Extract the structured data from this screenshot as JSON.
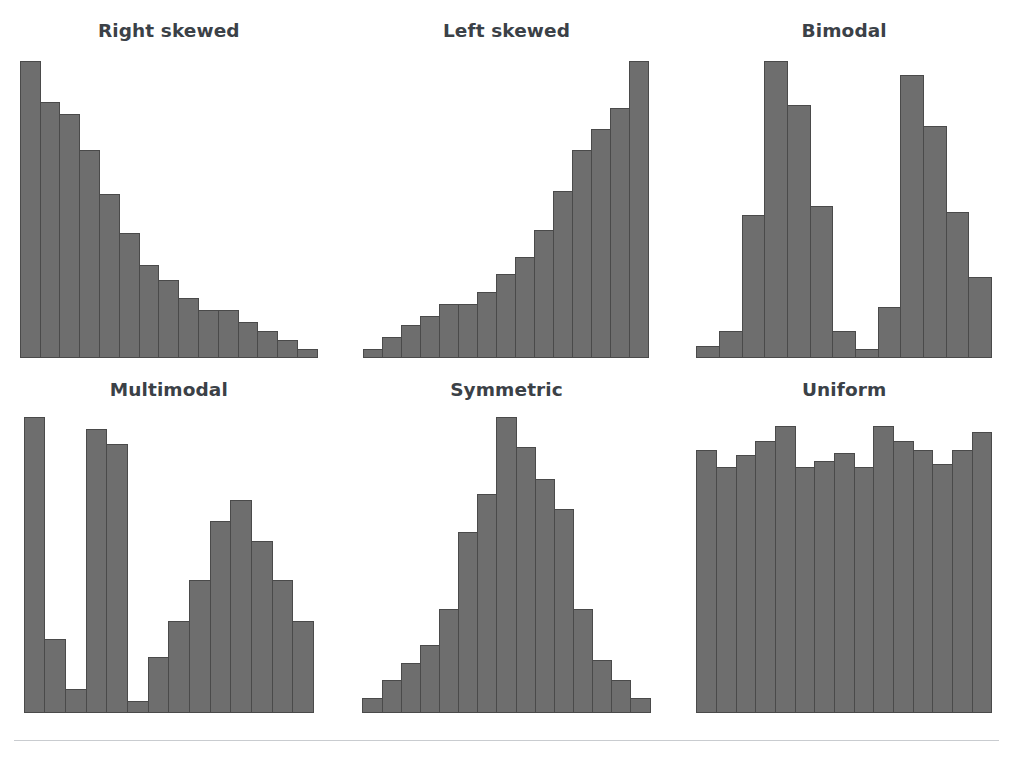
{
  "figure": {
    "background_color": "#ffffff",
    "bar_fill_color": "#6e6e6e",
    "bar_edge_color": "#4a4a4a",
    "title_color": "#3b4147",
    "rule_color": "#c9ccd0"
  },
  "panels": [
    {
      "title": "Right skewed"
    },
    {
      "title": "Left skewed"
    },
    {
      "title": "Bimodal"
    },
    {
      "title": "Multimodal"
    },
    {
      "title": "Symmetric"
    },
    {
      "title": "Uniform"
    }
  ],
  "chart_data": [
    {
      "type": "bar",
      "title": "Right skewed",
      "xlabel": "",
      "ylabel": "",
      "grid": false,
      "legend": false,
      "ylim": [
        0,
        100
      ],
      "categories": [
        "1",
        "2",
        "3",
        "4",
        "5",
        "6",
        "7",
        "8",
        "9",
        "10",
        "11",
        "12",
        "13",
        "14",
        "15"
      ],
      "values": [
        100,
        86,
        82,
        70,
        55,
        42,
        31,
        26,
        20,
        16,
        16,
        12,
        9,
        6,
        3
      ]
    },
    {
      "type": "bar",
      "title": "Left skewed",
      "xlabel": "",
      "ylabel": "",
      "grid": false,
      "legend": false,
      "ylim": [
        0,
        100
      ],
      "categories": [
        "1",
        "2",
        "3",
        "4",
        "5",
        "6",
        "7",
        "8",
        "9",
        "10",
        "11",
        "12",
        "13",
        "14",
        "15"
      ],
      "values": [
        3,
        7,
        11,
        14,
        18,
        18,
        22,
        28,
        34,
        43,
        56,
        70,
        77,
        84,
        100
      ]
    },
    {
      "type": "bar",
      "title": "Bimodal",
      "xlabel": "",
      "ylabel": "",
      "grid": false,
      "legend": false,
      "ylim": [
        0,
        100
      ],
      "categories": [
        "1",
        "2",
        "3",
        "4",
        "5",
        "6",
        "7",
        "8",
        "9",
        "10",
        "11",
        "12",
        "13"
      ],
      "values": [
        4,
        9,
        48,
        100,
        85,
        51,
        9,
        3,
        17,
        95,
        78,
        49,
        27
      ]
    },
    {
      "type": "bar",
      "title": "Multimodal",
      "xlabel": "",
      "ylabel": "",
      "grid": false,
      "legend": false,
      "ylim": [
        0,
        100
      ],
      "categories": [
        "1",
        "2",
        "3",
        "4",
        "5",
        "6",
        "7",
        "8",
        "9",
        "10",
        "11",
        "12",
        "13",
        "14"
      ],
      "values": [
        100,
        25,
        8,
        96,
        91,
        4,
        19,
        31,
        45,
        65,
        72,
        58,
        45,
        31
      ]
    },
    {
      "type": "bar",
      "title": "Symmetric",
      "xlabel": "",
      "ylabel": "",
      "grid": false,
      "legend": false,
      "ylim": [
        0,
        100
      ],
      "categories": [
        "1",
        "2",
        "3",
        "4",
        "5",
        "6",
        "7",
        "8",
        "9",
        "10",
        "11",
        "12",
        "13",
        "14",
        "15"
      ],
      "values": [
        5,
        11,
        17,
        23,
        35,
        61,
        74,
        100,
        90,
        79,
        69,
        35,
        18,
        11,
        5
      ]
    },
    {
      "type": "bar",
      "title": "Uniform",
      "xlabel": "",
      "ylabel": "",
      "grid": false,
      "legend": false,
      "ylim": [
        0,
        100
      ],
      "categories": [
        "1",
        "2",
        "3",
        "4",
        "5",
        "6",
        "7",
        "8",
        "9",
        "10",
        "11",
        "12",
        "13",
        "14",
        "15"
      ],
      "values": [
        89,
        83,
        87,
        92,
        97,
        83,
        85,
        88,
        83,
        97,
        92,
        89,
        84,
        89,
        95
      ]
    }
  ]
}
